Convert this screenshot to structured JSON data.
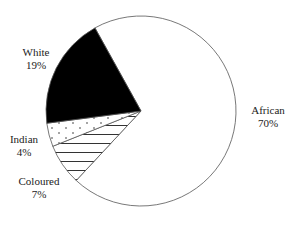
{
  "chart_data": {
    "type": "pie",
    "title": "",
    "categories": [
      "African",
      "Coloured",
      "Indian",
      "White"
    ],
    "values": [
      70,
      7,
      4,
      19
    ],
    "labels": [
      {
        "name": "African",
        "pct": "70%"
      },
      {
        "name": "Coloured",
        "pct": "7%"
      },
      {
        "name": "Indian",
        "pct": "4%"
      },
      {
        "name": "White",
        "pct": "19%"
      }
    ],
    "fills": {
      "African": "white",
      "Coloured": "horizontal-hatch",
      "Indian": "dotted",
      "White": "black"
    },
    "legend": "none (direct labels)"
  }
}
